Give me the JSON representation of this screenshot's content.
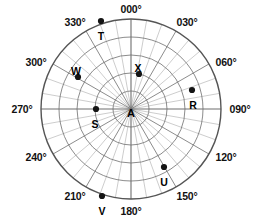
{
  "figure": {
    "type": "polar-plot",
    "title": "",
    "center_label": "A",
    "background_color": "#ffffff",
    "grid_color": "#9a9a9a",
    "major_grid_color": "#6e6e6e",
    "outer_circle_color": "#555555",
    "point_color": "#141414",
    "text_color": "#111111"
  },
  "geometry": {
    "center_x": 131,
    "center_y": 109,
    "outer_radius": 90,
    "ring_radii": [
      18,
      36,
      54,
      72,
      90
    ],
    "spoke_step_degrees": 10,
    "major_spoke_step_degrees": 30,
    "axis_spokes_degrees": [
      0,
      90,
      180,
      270
    ]
  },
  "angle_labels": [
    {
      "text": "000°",
      "degrees": 0,
      "x": 131,
      "y": 9
    },
    {
      "text": "030°",
      "degrees": 30,
      "x": 187,
      "y": 22
    },
    {
      "text": "060°",
      "degrees": 60,
      "x": 226,
      "y": 62
    },
    {
      "text": "090°",
      "degrees": 90,
      "x": 240,
      "y": 109
    },
    {
      "text": "120°",
      "degrees": 120,
      "x": 226,
      "y": 157
    },
    {
      "text": "150°",
      "degrees": 150,
      "x": 187,
      "y": 196
    },
    {
      "text": "180°",
      "degrees": 180,
      "x": 131,
      "y": 211
    },
    {
      "text": "210°",
      "degrees": 210,
      "x": 75,
      "y": 196
    },
    {
      "text": "240°",
      "degrees": 240,
      "x": 36,
      "y": 157
    },
    {
      "text": "270°",
      "degrees": 270,
      "x": 22,
      "y": 109
    },
    {
      "text": "300°",
      "degrees": 300,
      "x": 36,
      "y": 62
    },
    {
      "text": "330°",
      "degrees": 330,
      "x": 75,
      "y": 22
    }
  ],
  "chart_data": {
    "type": "scatter",
    "coordinate_system": "polar",
    "angle_convention": "bearing-clockwise-from-north",
    "title": "",
    "xlabel": "",
    "ylabel": "",
    "rlim": [
      0,
      5
    ],
    "grid": true,
    "legend": "none",
    "angle_ticks": [
      "000°",
      "030°",
      "060°",
      "090°",
      "120°",
      "150°",
      "180°",
      "210°",
      "240°",
      "270°",
      "300°",
      "330°"
    ],
    "radial_rings": [
      1,
      2,
      3,
      4,
      5
    ],
    "points": [
      {
        "label": "A",
        "bearing_deg": 0,
        "radius": 0.0,
        "px": 131,
        "py": 109,
        "is_center": true,
        "label_dx": 0,
        "label_dy": 4
      },
      {
        "label": "R",
        "bearing_deg": 73,
        "radius": 3.6,
        "px": 192,
        "py": 90,
        "is_center": false,
        "label_dx": 1,
        "label_dy": 15
      },
      {
        "label": "S",
        "bearing_deg": 270,
        "radius": 2.0,
        "px": 96,
        "py": 109,
        "is_center": false,
        "label_dx": -1,
        "label_dy": 15
      },
      {
        "label": "T",
        "bearing_deg": 341,
        "radius": 5.0,
        "px": 101,
        "py": 21,
        "is_center": false,
        "label_dx": 0,
        "label_dy": 15
      },
      {
        "label": "U",
        "bearing_deg": 152,
        "radius": 3.7,
        "px": 164,
        "py": 167,
        "is_center": false,
        "label_dx": 0,
        "label_dy": 15
      },
      {
        "label": "V",
        "bearing_deg": 197,
        "radius": 5.0,
        "px": 102,
        "py": 196,
        "is_center": false,
        "label_dx": 0,
        "label_dy": 15
      },
      {
        "label": "W",
        "bearing_deg": 301,
        "radius": 3.5,
        "px": 78,
        "py": 77,
        "is_center": false,
        "label_dx": -2,
        "label_dy": -6
      },
      {
        "label": "X",
        "bearing_deg": 13,
        "radius": 2.0,
        "px": 139,
        "py": 74,
        "is_center": false,
        "label_dx": -1,
        "label_dy": -6
      }
    ]
  }
}
